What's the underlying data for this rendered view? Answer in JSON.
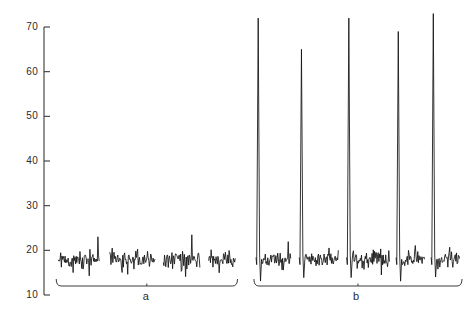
{
  "chart_data": {
    "type": "line",
    "title": "",
    "xlabel": "",
    "ylabel": "",
    "ylim": [
      10,
      70
    ],
    "yticks": [
      10,
      20,
      30,
      40,
      50,
      60,
      70
    ],
    "ytick_labels": [
      "10",
      "20",
      "30",
      "40",
      "50",
      "60",
      "70"
    ],
    "xlim": [
      0,
      100
    ],
    "grid": false,
    "legend": null,
    "axis_color": "#3a3a3a",
    "trace_color": "#111111",
    "baseline_level": 18,
    "noise_amplitude": 2.0,
    "annotations": [
      {
        "name": "bracket-a",
        "label": "a",
        "x_start": 1.5,
        "x_end": 45.5,
        "label_x": 23.5
      },
      {
        "name": "bracket-b",
        "label": "b",
        "x_start": 49.5,
        "x_end": 100.0,
        "label_x": 74.5
      }
    ],
    "groups": [
      {
        "name": "a",
        "label": "a",
        "has_peaks": false,
        "segments": [
          {
            "x_start": 2.0,
            "x_end": 12.0,
            "peak_value": null,
            "baseline": 18.0
          },
          {
            "x_start": 14.5,
            "x_end": 25.5,
            "peak_value": null,
            "baseline": 18.0
          },
          {
            "x_start": 27.5,
            "x_end": 36.5,
            "peak_value": null,
            "baseline": 18.0
          },
          {
            "x_start": 38.5,
            "x_end": 45.0,
            "peak_value": null,
            "baseline": 18.0
          }
        ]
      },
      {
        "name": "b",
        "label": "b",
        "has_peaks": true,
        "segments": [
          {
            "x_start": 50.0,
            "x_end": 58.5,
            "peak_value": 72.0,
            "baseline": 18.0
          },
          {
            "x_start": 60.5,
            "x_end": 70.0,
            "peak_value": 65.0,
            "baseline": 18.0
          },
          {
            "x_start": 72.0,
            "x_end": 82.5,
            "peak_value": 72.0,
            "baseline": 18.0
          },
          {
            "x_start": 84.0,
            "x_end": 91.0,
            "peak_value": 69.0,
            "baseline": 18.0
          },
          {
            "x_start": 92.5,
            "x_end": 99.5,
            "peak_value": 73.0,
            "baseline": 18.0
          }
        ]
      }
    ],
    "peaks": [
      {
        "group": "b",
        "index": 1,
        "x": 50.4,
        "value": 72.0
      },
      {
        "group": "b",
        "index": 2,
        "x": 61.0,
        "value": 65.0
      },
      {
        "group": "b",
        "index": 3,
        "x": 72.4,
        "value": 72.0
      },
      {
        "group": "b",
        "index": 4,
        "x": 84.4,
        "value": 69.0
      },
      {
        "group": "b",
        "index": 5,
        "x": 92.9,
        "value": 73.0
      }
    ]
  }
}
